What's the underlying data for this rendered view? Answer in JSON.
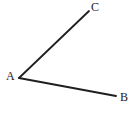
{
  "figure": {
    "kind": "angle-diagram",
    "width": 136,
    "height": 115,
    "background_color": "#ffffff",
    "stroke_color": "#1f1f1f",
    "stroke_width": 1.8,
    "label_color": "#1a1a1a"
  },
  "points": {
    "A": {
      "label": "A",
      "x": 19,
      "y": 78,
      "label_x": 6,
      "label_y": 70
    },
    "B": {
      "label": "B",
      "x": 116,
      "y": 96,
      "label_x": 120,
      "label_y": 91
    },
    "C": {
      "label": "C",
      "x": 89,
      "y": 11,
      "label_x": 91,
      "label_y": 1
    }
  },
  "segments": [
    {
      "name": "ray-AC",
      "from": "A",
      "to": "C",
      "x1": 19,
      "y1": 78,
      "x2": 89,
      "y2": 11
    },
    {
      "name": "ray-AB",
      "from": "A",
      "to": "B",
      "x1": 19,
      "y1": 78,
      "x2": 116,
      "y2": 96
    }
  ],
  "chart_data": {
    "type": "scatter",
    "title": "",
    "xlabel": "",
    "ylabel": "",
    "xlim": [
      0,
      136
    ],
    "ylim": [
      0,
      115
    ],
    "grid": false,
    "legend": null,
    "annotations": [
      "A",
      "B",
      "C"
    ],
    "series": [
      {
        "name": "ray-AC",
        "x": [
          19,
          89
        ],
        "y": [
          78,
          11
        ]
      },
      {
        "name": "ray-AB",
        "x": [
          19,
          116
        ],
        "y": [
          78,
          96
        ]
      }
    ]
  }
}
